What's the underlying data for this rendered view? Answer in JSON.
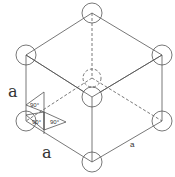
{
  "diagram": {
    "type": "simple cubic unit cell (isometric)",
    "labels": {
      "edge_left": "a",
      "edge_bottom_left": "a",
      "edge_bottom_right": "a",
      "angle_top": "90°",
      "angle_left": "90°",
      "angle_right": "90°"
    },
    "atoms": [
      {
        "name": "top",
        "x": 92,
        "y": 13,
        "hidden": false
      },
      {
        "name": "upper-left",
        "x": 26,
        "y": 55,
        "hidden": false
      },
      {
        "name": "upper-right",
        "x": 162,
        "y": 55,
        "hidden": false
      },
      {
        "name": "front-center",
        "x": 92,
        "y": 97,
        "hidden": false
      },
      {
        "name": "back-hidden",
        "x": 92,
        "y": 78,
        "hidden": true
      },
      {
        "name": "lower-left",
        "x": 26,
        "y": 121,
        "hidden": false
      },
      {
        "name": "lower-right",
        "x": 162,
        "y": 121,
        "hidden": false
      },
      {
        "name": "bottom",
        "x": 92,
        "y": 162,
        "hidden": false
      }
    ],
    "colors": {
      "line": "#555555",
      "text": "#333333",
      "background": "#ffffff"
    }
  }
}
